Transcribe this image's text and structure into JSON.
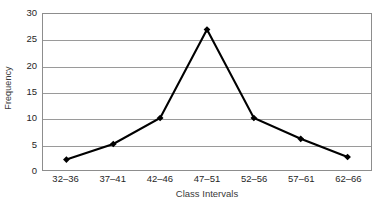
{
  "chart_data": {
    "type": "line",
    "title": "",
    "xlabel": "Class Intervals",
    "ylabel": "Frequency",
    "categories": [
      "32–36",
      "37–41",
      "42–46",
      "47–51",
      "52–56",
      "57–61",
      "62–66"
    ],
    "values": [
      2,
      5,
      10,
      27,
      10,
      6,
      2.5
    ],
    "ylim": [
      0,
      30
    ],
    "yticks": [
      0,
      5,
      10,
      15,
      20,
      25,
      30
    ],
    "ytick_labels": [
      "0",
      "5",
      "10",
      "15",
      "20",
      "25",
      "30"
    ],
    "grid": true,
    "legend": false,
    "marker": "diamond",
    "series_color": "#000000",
    "gridline_color": "#9a9a9a",
    "axis_color": "#8d8d8d",
    "background_color": "#ffffff"
  }
}
